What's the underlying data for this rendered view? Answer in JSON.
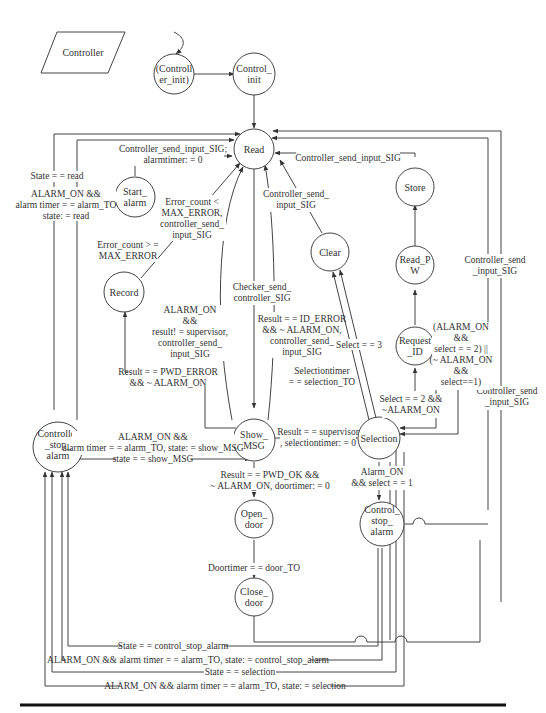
{
  "title": "Controller",
  "nodes": {
    "controller_init": [
      "(Controll",
      "er_init)"
    ],
    "control_init": [
      "Control_",
      "init"
    ],
    "read": [
      "Read"
    ],
    "start_alarm": [
      "Start_",
      "alarm"
    ],
    "record": [
      "Record"
    ],
    "clear": [
      "Clear"
    ],
    "store": [
      "Store"
    ],
    "read_pw": [
      "Read_P",
      "W"
    ],
    "request_id": [
      "Request",
      "_ID"
    ],
    "controller_stop_alarm": [
      "Controller",
      "_stop_",
      "alarm"
    ],
    "show_msg": [
      "Show_",
      "MSG"
    ],
    "selection": [
      "Selection"
    ],
    "control_stop_alarm": [
      "Control_",
      "stop_",
      "alarm"
    ],
    "open_door": [
      "Open_",
      "door"
    ],
    "close_door": [
      "Close_",
      "door"
    ]
  },
  "edges": {
    "start_alarm_to_read": [
      "Controller_send_input_SIG;",
      "alarmtimer: = 0"
    ],
    "state_read": [
      "State = = read"
    ],
    "alarm_to_read": [
      "ALARM_ON &&",
      "alarm timer = = alarm_TO",
      "state: = read"
    ],
    "record_to_read": [
      "Error_count <",
      "MAX_ERROR,",
      "controller_send_",
      "input_SIG"
    ],
    "record_to_start_alarm": [
      "Error_count > =",
      "MAX_ERROR"
    ],
    "clear_to_read": [
      "Controller_send_",
      "input_SIG"
    ],
    "store_to_read": [
      "Controller_send_input_SIG"
    ],
    "right_to_read": [
      "Controller_send",
      "_input_SIG"
    ],
    "right_to_control_stop": [
      "Controller_send",
      "_input_SIG"
    ],
    "read_to_show_msg": [
      "Checker_send_",
      "controller_SIG"
    ],
    "show_msg_to_read_alarm": [
      "ALARM_ON",
      "&&",
      "result! = supervisor,",
      "controller_send_",
      "input_SIG"
    ],
    "show_msg_to_read_id_error": [
      "Result = = ID_ERROR",
      "&& ~ ALARM_ON,",
      "controller_send_",
      "input_SIG"
    ],
    "show_msg_to_record": [
      "Result = = PWD_ERROR",
      "&& ~ ALARM_ON"
    ],
    "selection_to_clear": [
      "Select = = 3"
    ],
    "selection_timeout": [
      "Selectiontimer",
      "= = selection_TO"
    ],
    "selection_to_request_id": [
      "Select = = 2 &&",
      "~ALARM_ON"
    ],
    "request_id_alarm": [
      "(ALARM_ON",
      "&&",
      "select = = 2) ||",
      "(~ ALARM_ON",
      "&&",
      "select==1)"
    ],
    "show_msg_to_selection": [
      "Result = = supervisor",
      ", selectiontimer: = 0"
    ],
    "show_msg_to_controller_stop": [
      "ALARM_ON &&",
      "alarm timer = = alarm_TO, state: = show_MSG"
    ],
    "controller_stop_to_show_msg": [
      "state = = show_MSG"
    ],
    "show_msg_to_open_door": [
      "Result = = PWD_OK &&",
      "~ ALARM_ON, doortimer: = 0"
    ],
    "selection_to_control_stop": [
      "Alarm_ON",
      "&& select = = 1"
    ],
    "open_to_close_door": [
      "Doortimer = = door_TO"
    ],
    "bottom_1": [
      "State = = control_stop_alarm"
    ],
    "bottom_2": [
      "ALARM_ON && alarm timer = = alarm_TO, state: = control_stop_alarm"
    ],
    "bottom_3": [
      "State = = selection"
    ],
    "bottom_4": [
      "ALARM_ON && alarm timer = = alarm_TO, state: = selection"
    ]
  }
}
